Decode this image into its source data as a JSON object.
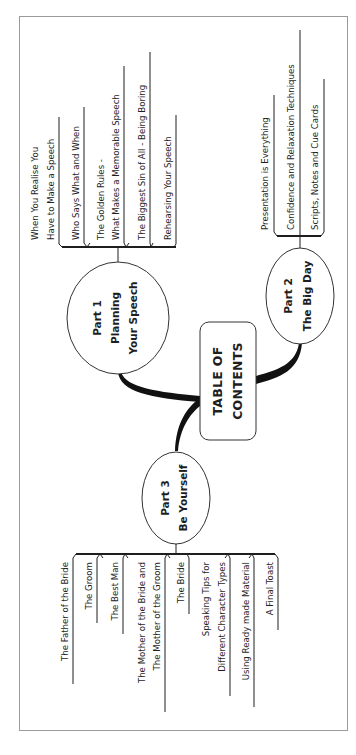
{
  "diagram": {
    "title": "TABLE OF CONTENTS",
    "title_lines": [
      "TABLE OF",
      "CONTENTS"
    ],
    "orientation": "rotated 90 degrees counter-clockwise",
    "colors": {
      "ink": "#1e1e1e",
      "frame": "#9a9a9a",
      "background": "#ffffff"
    },
    "parts": [
      {
        "id": "part1",
        "label": "Part 1",
        "subtitle_lines": [
          "Planning",
          "Your Speech"
        ],
        "children": [
          {
            "lines": [
              "When You Realise You",
              "Have to Make a Speech"
            ]
          },
          {
            "lines": [
              "Who Says What and When"
            ]
          },
          {
            "lines": [
              "The Golden Rules -",
              "What Makes a Memorable Speech"
            ]
          },
          {
            "lines": [
              "The Biggest Sin of All - Being Boring"
            ]
          },
          {
            "lines": [
              "Rehearsing Your Speech"
            ]
          }
        ]
      },
      {
        "id": "part2",
        "label": "Part 2",
        "subtitle_lines": [
          "The Big Day"
        ],
        "children": [
          {
            "lines": [
              "Presentation is Everything"
            ]
          },
          {
            "lines": [
              "Confidence and Relaxation Techniques"
            ]
          },
          {
            "lines": [
              "Scripts, Notes and Cue Cards"
            ]
          }
        ]
      },
      {
        "id": "part3",
        "label": "Part 3",
        "subtitle_lines": [
          "Be Yourself"
        ],
        "children": [
          {
            "lines": [
              "The Father of the Bride"
            ]
          },
          {
            "lines": [
              "The Groom"
            ]
          },
          {
            "lines": [
              "The Best Man"
            ]
          },
          {
            "lines": [
              "The Mother of the Bride and",
              "The Mother of the Groom"
            ]
          },
          {
            "lines": [
              "The Bride"
            ]
          },
          {
            "lines": [
              "Speaking Tips for",
              "Different Character Types"
            ]
          },
          {
            "lines": [
              "Using Ready  made Material"
            ]
          },
          {
            "lines": [
              "A Final Toast"
            ]
          }
        ]
      }
    ]
  }
}
